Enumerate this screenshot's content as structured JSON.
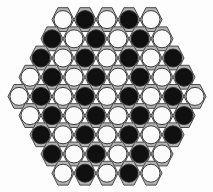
{
  "board": {
    "name": "hexagonal-peg-board",
    "shape": "hexagon",
    "rows_count": 9,
    "cells_total": 61,
    "row_lengths": [
      5,
      6,
      7,
      8,
      9,
      8,
      7,
      6,
      5
    ],
    "piece_colors": {
      "black": "#101010",
      "white": "#fbfbfb"
    },
    "cell_colors": {
      "hex_fill": "#b2b2b2",
      "hex_stroke": "#4a4a4a",
      "piece_stroke": "#2a2a2a"
    },
    "background_color": "#fdfdfd",
    "geometry": {
      "cell_width": 22.0,
      "row_pitch": 19.2,
      "circle_radius": 9.0,
      "origin_x": 8.0,
      "origin_y": 10.0
    },
    "rows": [
      {
        "index": 1,
        "count": 5,
        "cells": [
          "white",
          "black",
          "white",
          "black",
          "white"
        ]
      },
      {
        "index": 2,
        "count": 6,
        "cells": [
          "black",
          "white",
          "black",
          "white",
          "black",
          "white"
        ]
      },
      {
        "index": 3,
        "count": 7,
        "cells": [
          "black",
          "white",
          "black",
          "white",
          "black",
          "white",
          "black"
        ]
      },
      {
        "index": 4,
        "count": 8,
        "cells": [
          "white",
          "black",
          "white",
          "black",
          "white",
          "black",
          "white",
          "black"
        ]
      },
      {
        "index": 5,
        "count": 9,
        "cells": [
          "white",
          "black",
          "white",
          "black",
          "white",
          "black",
          "white",
          "black",
          "white"
        ]
      },
      {
        "index": 6,
        "count": 8,
        "cells": [
          "white",
          "black",
          "white",
          "black",
          "white",
          "black",
          "white",
          "black"
        ]
      },
      {
        "index": 7,
        "count": 7,
        "cells": [
          "black",
          "white",
          "black",
          "white",
          "black",
          "white",
          "black"
        ]
      },
      {
        "index": 8,
        "count": 6,
        "cells": [
          "black",
          "white",
          "black",
          "white",
          "black",
          "white"
        ]
      },
      {
        "index": 9,
        "count": 5,
        "cells": [
          "white",
          "black",
          "white",
          "black",
          "white"
        ]
      }
    ]
  }
}
